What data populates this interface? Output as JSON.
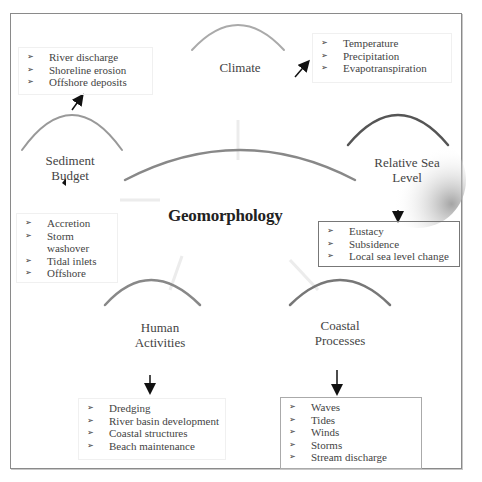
{
  "diagram": {
    "center": {
      "title": "Geomorphology"
    },
    "nodes": [
      {
        "id": "climate",
        "label": "Climate",
        "items": [
          "Temperature",
          "Precipitation",
          "Evapotranspiration"
        ]
      },
      {
        "id": "sediment-budget",
        "label_line1": "Sediment",
        "label_line2": "Budget",
        "items_top": [
          "River discharge",
          "Shoreline erosion",
          "Offshore deposits"
        ],
        "items_bottom": [
          "Accretion",
          "Storm washover",
          "Tidal inlets",
          "Offshore"
        ]
      },
      {
        "id": "relative-sea-level",
        "label_line1": "Relative Sea",
        "label_line2": "Level",
        "items": [
          "Eustacy",
          "Subsidence",
          "Local sea level change"
        ]
      },
      {
        "id": "human-activities",
        "label_line1": "Human",
        "label_line2": "Activities",
        "items": [
          "Dredging",
          "River basin development",
          "Coastal structures",
          "Beach maintenance"
        ]
      },
      {
        "id": "coastal-processes",
        "label_line1": "Coastal",
        "label_line2": "Processes",
        "items": [
          "Waves",
          "Tides",
          "Winds",
          "Storms",
          "Stream discharge"
        ]
      }
    ],
    "bullet_glyph": "➢"
  }
}
